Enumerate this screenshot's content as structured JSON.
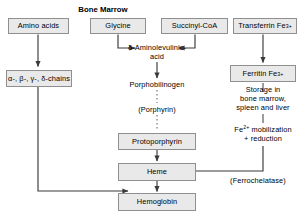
{
  "diagram": {
    "title": "Bone Marrow",
    "boxes": {
      "amino_acids": "Amino acids",
      "glycine": "Glycine",
      "succinyl_coa": "Succinyl-CoA",
      "transferrin": "Transferrin Fe",
      "transferrin_sup": "3+",
      "chains": "α-, β-, γ-, δ-chains",
      "ferritin": "Ferritin Fe",
      "ferritin_sup": "3+",
      "protoporphyrin": "Protoporphyrin",
      "heme": "Heme",
      "hemoglobin": "Hemoglobin"
    },
    "labels": {
      "ala_line1": "δ-Aminolevulinic-",
      "ala_line2": "acid",
      "porphobilinogen": "Porphobilinogen",
      "porphyrin": "(Porphyrin)",
      "storage_line1": "Storage in",
      "storage_line2": "bone marrow,",
      "storage_line3": "spleen and liver",
      "mobilization_prefix": "Fe",
      "mobilization_sup": "2+",
      "mobilization_rest": " mobilization",
      "mobilization_line2": "+ reduction",
      "ferrochelatase": "(Ferrochelatase)"
    },
    "colors": {
      "box_fill": "#e9e9e9",
      "box_border": "#8f8f8f",
      "line": "#3a3a3a",
      "text": "#000000",
      "background": "#ffffff"
    }
  }
}
